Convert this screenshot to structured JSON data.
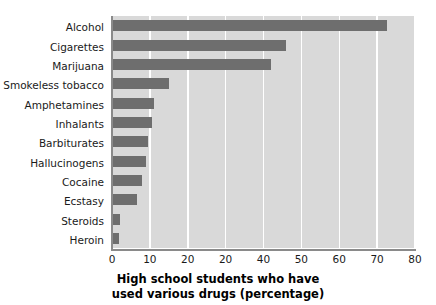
{
  "chart_data": {
    "type": "bar",
    "orientation": "horizontal",
    "title": "",
    "xlabel": "High school students who have used various drugs (percentage)",
    "xlabel_lines": [
      "High school students who have",
      "used various drugs (percentage)"
    ],
    "ylabel": "",
    "categories": [
      "Alcohol",
      "Cigarettes",
      "Marijuana",
      "Smokeless tobacco",
      "Amphetamines",
      "Inhalants",
      "Barbiturates",
      "Hallucinogens",
      "Cocaine",
      "Ecstasy",
      "Steroids",
      "Heroin"
    ],
    "values": [
      72.5,
      46,
      42,
      15,
      11,
      10.5,
      9.5,
      9,
      8,
      6.5,
      2,
      1.8
    ],
    "xlim": [
      0,
      80
    ],
    "xticks": [
      0,
      10,
      20,
      30,
      40,
      50,
      60,
      70,
      80
    ],
    "xtick_labels": [
      "0",
      "10",
      "20",
      "20",
      "40",
      "50",
      "60",
      "70",
      "80"
    ],
    "grid": "vertical-only",
    "legend": "none",
    "colors": {
      "bar": "#6e6e6e",
      "plot_background": "#d9d9d9",
      "gridline": "#ffffff",
      "axis_line": "#8a8a8a",
      "text": "#1a1a1a",
      "page_background": "#ffffff"
    }
  }
}
